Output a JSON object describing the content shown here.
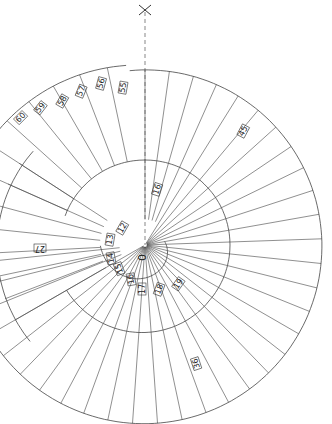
{
  "diagram": {
    "type": "spiral-staircase-plan",
    "axis_label": "X",
    "center_label": "0",
    "stroke_color": "#444444",
    "background": "#ffffff",
    "center": {
      "x": 145,
      "y": 245
    },
    "outer_radius": 180,
    "inner_radius": 85,
    "core_radius": 22,
    "tread_count_outer": 36,
    "tread_labels": [
      {
        "id": "t12",
        "text": "12",
        "x": 124,
        "y": 229,
        "rot": -60
      },
      {
        "id": "t13",
        "text": "13",
        "x": 112,
        "y": 240,
        "rot": -80
      },
      {
        "id": "t14",
        "text": "14",
        "x": 113,
        "y": 258,
        "rot": -100
      },
      {
        "id": "t15",
        "text": "15",
        "x": 121,
        "y": 268,
        "rot": -110
      },
      {
        "id": "t16a",
        "text": "16",
        "x": 133,
        "y": 279,
        "rot": -100
      },
      {
        "id": "t17",
        "text": "17",
        "x": 144,
        "y": 289,
        "rot": -90
      },
      {
        "id": "t18",
        "text": "18",
        "x": 161,
        "y": 290,
        "rot": -70
      },
      {
        "id": "t19",
        "text": "19",
        "x": 180,
        "y": 285,
        "rot": -55
      },
      {
        "id": "t16b",
        "text": "16",
        "x": 159,
        "y": 190,
        "rot": -72
      },
      {
        "id": "t27",
        "text": "27",
        "x": 40,
        "y": 246,
        "rot": 180
      },
      {
        "id": "t36",
        "text": "36",
        "x": 198,
        "y": 363,
        "rot": -108
      },
      {
        "id": "t45",
        "text": "45",
        "x": 245,
        "y": 132,
        "rot": -62
      },
      {
        "id": "t55",
        "text": "55",
        "x": 125,
        "y": 88,
        "rot": -80
      },
      {
        "id": "t56",
        "text": "56",
        "x": 103,
        "y": 84,
        "rot": -75
      },
      {
        "id": "t57",
        "text": "57",
        "x": 83,
        "y": 92,
        "rot": -68
      },
      {
        "id": "t58",
        "text": "58",
        "x": 64,
        "y": 102,
        "rot": -60
      },
      {
        "id": "t59",
        "text": "59",
        "x": 42,
        "y": 109,
        "rot": -52
      },
      {
        "id": "t60",
        "text": "60",
        "x": 22,
        "y": 119,
        "rot": -45
      }
    ]
  }
}
